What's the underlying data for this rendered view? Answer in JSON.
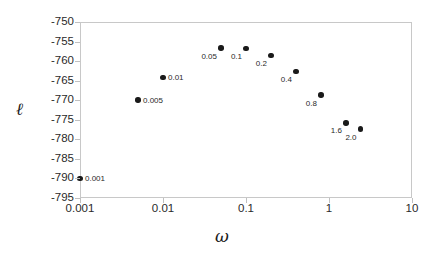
{
  "chart_data": {
    "type": "scatter",
    "title": "",
    "xlabel": "ω",
    "ylabel": "ℓ",
    "xscale": "log",
    "yscale": "linear",
    "xlim": [
      0.001,
      10
    ],
    "ylim": [
      -795,
      -750
    ],
    "grid": false,
    "legend": null,
    "x_tick_labels": [
      "0.001",
      "0.01",
      "0.1",
      "1",
      "10"
    ],
    "x_tick_values": [
      0.001,
      0.01,
      0.1,
      1,
      10
    ],
    "y_tick_labels": [
      "-750",
      "-755",
      "-760",
      "-765",
      "-770",
      "-775",
      "-780",
      "-785",
      "-790",
      "-795"
    ],
    "y_tick_values": [
      -750,
      -755,
      -760,
      -765,
      -770,
      -775,
      -780,
      -785,
      -790,
      -795
    ],
    "points": [
      {
        "label": "0.001",
        "x": 0.001,
        "y": -790.0,
        "label_side": "right"
      },
      {
        "label": "0.005",
        "x": 0.005,
        "y": -770.0,
        "label_side": "right"
      },
      {
        "label": "0.01",
        "x": 0.01,
        "y": -764.2,
        "label_side": "right"
      },
      {
        "label": "0.05",
        "x": 0.05,
        "y": -756.7,
        "label_side": "below-left"
      },
      {
        "label": "0.1",
        "x": 0.1,
        "y": -756.8,
        "label_side": "below-left"
      },
      {
        "label": "0.2",
        "x": 0.2,
        "y": -758.6,
        "label_side": "below-left"
      },
      {
        "label": "0.4",
        "x": 0.4,
        "y": -762.6,
        "label_side": "below-left"
      },
      {
        "label": "0.8",
        "x": 0.8,
        "y": -768.7,
        "label_side": "below-left"
      },
      {
        "label": "1.6",
        "x": 1.6,
        "y": -775.8,
        "label_side": "below-left"
      },
      {
        "label": "2.0",
        "x": 2.4,
        "y": -777.4,
        "label_side": "below-left"
      }
    ]
  },
  "style": {
    "marker_color": "#1a1a1a",
    "axis_color": "#c8c8c8",
    "text_color": "#2a2a2a",
    "background": "#ffffff"
  }
}
